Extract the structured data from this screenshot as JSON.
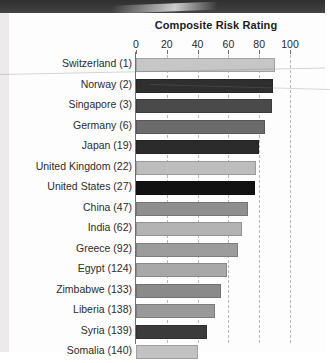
{
  "chart_data": {
    "type": "bar",
    "orientation": "horizontal",
    "title": "Composite Risk Rating",
    "xlabel": "",
    "ylabel": "",
    "xlim": [
      0,
      110
    ],
    "xticks": [
      0,
      20,
      40,
      60,
      80,
      100
    ],
    "xtick_labels": [
      "0",
      "20",
      "40",
      "60",
      "80",
      "100"
    ],
    "grid": "vertical-dashed",
    "legend": "none",
    "categories": [
      "Switzerland (1)",
      "Norway (2)",
      "Singapore (3)",
      "Germany (6)",
      "Japan (19)",
      "United Kingdom (22)",
      "United States (27)",
      "China (47)",
      "India (62)",
      "Greece (92)",
      "Egypt (124)",
      "Zimbabwe (133)",
      "Liberia (138)",
      "Syria (139)",
      "Somalia (140)"
    ],
    "values": [
      90,
      89,
      88,
      84,
      80,
      78,
      77,
      73,
      69,
      66,
      59,
      55,
      51,
      46,
      40
    ],
    "bar_colors": [
      "#c6c6c6",
      "#2f2f2f",
      "#4a4a4a",
      "#6b6b6b",
      "#2b2b2b",
      "#bdbdbd",
      "#121212",
      "#8f8f8f",
      "#b3b3b3",
      "#9c9c9c",
      "#a8a8a8",
      "#8a8a8a",
      "#999999",
      "#3b3b3b",
      "#c2c2c2"
    ]
  },
  "page": {
    "grid_color": "#b9b9b9",
    "axis_color": "#6f6f6f",
    "text_color": "#2c2c2c"
  }
}
